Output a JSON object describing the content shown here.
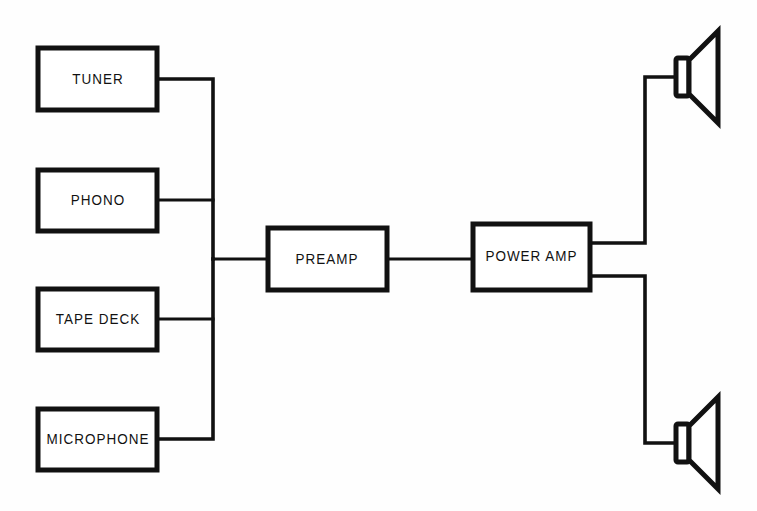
{
  "diagram": {
    "background_color": "#fefefe",
    "line_color": "#111111",
    "box_fill_color": "#ffffff",
    "blocks": [
      {
        "id": "tuner",
        "label": "TUNER",
        "x": 38,
        "y": 48,
        "w": 119,
        "h": 62
      },
      {
        "id": "phono",
        "label": "PHONO",
        "x": 38,
        "y": 170,
        "w": 119,
        "h": 61
      },
      {
        "id": "tape_deck",
        "label": "TAPE DECK",
        "x": 38,
        "y": 289,
        "w": 119,
        "h": 61
      },
      {
        "id": "microphone",
        "label": "MICROPHONE",
        "x": 38,
        "y": 409,
        "w": 119,
        "h": 61
      },
      {
        "id": "preamp",
        "label": "PREAMP",
        "x": 268,
        "y": 228,
        "w": 119,
        "h": 62
      },
      {
        "id": "power_amp",
        "label": "POWER AMP",
        "x": 473,
        "y": 224,
        "w": 117,
        "h": 66
      }
    ],
    "speakers": [
      {
        "id": "speaker_top",
        "label": "speaker",
        "cone_x": 686,
        "cone_top": 32,
        "cone_bottom": 118,
        "coil_y": 57,
        "apex_y": 77
      },
      {
        "id": "speaker_bottom",
        "label": "speaker",
        "cone_x": 686,
        "cone_top": 398,
        "cone_bottom": 484,
        "coil_y": 423,
        "apex_y": 443
      }
    ],
    "bus": {
      "x": 213,
      "top_y": 79,
      "bottom_y": 439,
      "tap_y": 259
    },
    "connections": [
      {
        "from": "tuner",
        "to": "input-bus",
        "label": "tuner to bus"
      },
      {
        "from": "phono",
        "to": "input-bus",
        "label": "phono to bus"
      },
      {
        "from": "tape_deck",
        "to": "input-bus",
        "label": "tape deck to bus"
      },
      {
        "from": "microphone",
        "to": "input-bus",
        "label": "microphone to bus"
      },
      {
        "from": "input-bus",
        "to": "preamp",
        "label": "bus to preamp"
      },
      {
        "from": "preamp",
        "to": "power_amp",
        "label": "preamp to power amp"
      },
      {
        "from": "power_amp",
        "to": "speaker_top",
        "label": "power amp to top speaker"
      },
      {
        "from": "power_amp",
        "to": "speaker_bottom",
        "label": "power amp to bottom speaker"
      }
    ]
  }
}
